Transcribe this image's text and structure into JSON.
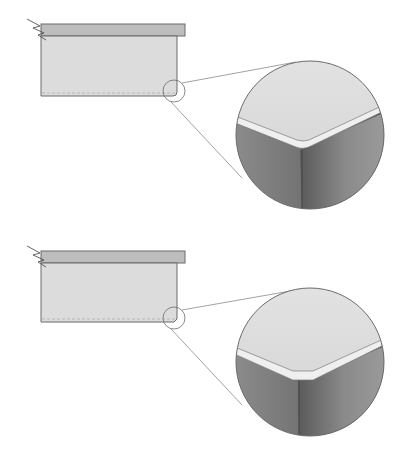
{
  "diagram": {
    "panels": [
      {
        "id": "rounded",
        "edge_type": "rounded-edge",
        "offset_y": 0
      },
      {
        "id": "chamfered",
        "edge_type": "chamfered-edge",
        "offset_y": 230
      }
    ],
    "colors": {
      "background": "#ffffff",
      "top_strip": "#b9b9b9",
      "body_fill": "#dcdcdc",
      "outline": "#6b6b6b",
      "leader": "#8a8a8a",
      "detail_top": "#d9d9d9",
      "detail_bevel": "#efefef",
      "detail_side_dark": "#6e6e6e",
      "detail_side_mid": "#9a9a9a"
    }
  }
}
